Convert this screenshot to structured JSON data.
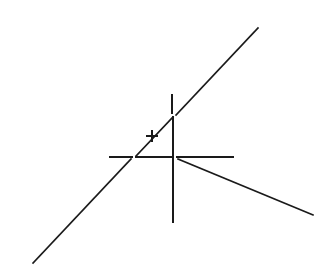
{
  "canvas": {
    "width": 330,
    "height": 278,
    "background": "#ffffff"
  },
  "style": {
    "stroke": "#1a1a1a",
    "diagonal_stroke_width": 1.6,
    "cross_stroke_width": 2
  },
  "geometry": {
    "diagonal_lower": {
      "x1": 33,
      "y1": 263,
      "x2": 131,
      "y2": 159
    },
    "diagonal_upper": {
      "x1": 176,
      "y1": 115,
      "x2": 258,
      "y2": 28
    },
    "hypotenuse": {
      "x1": 136,
      "y1": 156,
      "x2": 173,
      "y2": 117
    },
    "crosshair_h_left": {
      "x1": 110,
      "y1": 157,
      "x2": 132,
      "y2": 157
    },
    "crosshair_h_mid": {
      "x1": 136,
      "y1": 157,
      "x2": 173,
      "y2": 157
    },
    "crosshair_h_right": {
      "x1": 177,
      "y1": 157,
      "x2": 233,
      "y2": 157
    },
    "crosshair_v_top": {
      "x1": 172,
      "y1": 95,
      "x2": 172,
      "y2": 113
    },
    "crosshair_v_mid": {
      "x1": 173,
      "y1": 117,
      "x2": 173,
      "y2": 157
    },
    "crosshair_v_bottom": {
      "x1": 173,
      "y1": 157,
      "x2": 173,
      "y2": 222
    },
    "ray": {
      "x1": 178,
      "y1": 159,
      "x2": 313,
      "y2": 215
    },
    "cursor_plus": {
      "cx": 152,
      "cy": 136,
      "size": 10
    }
  }
}
